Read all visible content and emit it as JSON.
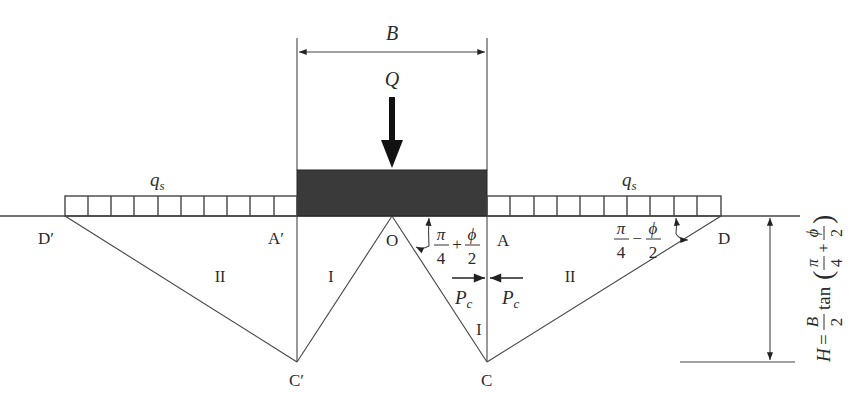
{
  "diagram": {
    "type": "bearing-capacity-failure-mechanism",
    "dimension_top": {
      "label": "B"
    },
    "load": {
      "label": "Q"
    },
    "surcharge": {
      "left_label": "q",
      "left_sub": "s",
      "right_label": "q",
      "right_sub": "s",
      "left_cells": 10,
      "right_cells": 10
    },
    "points": {
      "D_prime": "D′",
      "A_prime": "A′",
      "O": "O",
      "A": "A",
      "D": "D",
      "C_prime": "C′",
      "C": "C"
    },
    "zones": {
      "left_II": "II",
      "left_I": "I",
      "right_I": "I",
      "right_II": "II"
    },
    "angles": {
      "wedge_angle": {
        "num1": "π",
        "den1": "4",
        "op": "+",
        "num2": "ϕ",
        "den2": "2"
      },
      "passive_angle": {
        "num1": "π",
        "den1": "4",
        "op": "−",
        "num2": "ϕ",
        "den2": "2"
      }
    },
    "pressures": {
      "left": "P",
      "right": "P",
      "sub": "c"
    },
    "height_formula": {
      "lhs": "H",
      "eq": "=",
      "frac_num": "B",
      "frac_den": "2",
      "fn": "tan",
      "inner": {
        "num1": "π",
        "den1": "4",
        "op": "+",
        "num2": "ϕ",
        "den2": "2"
      }
    }
  }
}
